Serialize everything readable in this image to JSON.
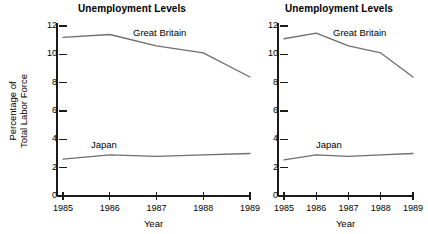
{
  "figure": {
    "background_color": "#ffffff",
    "line_color": "#6e6e6e",
    "axis_color": "#1a1a1a"
  },
  "charts": [
    {
      "id": "left",
      "title": "Unemployment Levels",
      "xlabel": "Year",
      "ylabel_line1": "Percentage of",
      "ylabel_line2": "Total Labor Force",
      "yticks": [
        "0",
        "2",
        "4",
        "6",
        "8",
        "10",
        "12"
      ],
      "xticks": [
        "1985",
        "1986",
        "1987",
        "1988",
        "1989"
      ],
      "series_labels": {
        "gb": "Great Britain",
        "japan": "Japan"
      }
    },
    {
      "id": "right",
      "title": "Unemployment Levels",
      "xlabel": "Year",
      "yticks": [
        "0",
        "2",
        "4",
        "6",
        "8",
        "10",
        "12"
      ],
      "xticks": [
        "1985",
        "1986",
        "1987",
        "1988",
        "1989"
      ],
      "series_labels": {
        "gb": "Great Britain",
        "japan": "Japan"
      }
    }
  ],
  "chart_data": [
    {
      "type": "line",
      "id": "left-chart",
      "title": "Unemployment Levels",
      "xlabel": "Year",
      "ylabel": "Percentage of Total Labor Force",
      "x": [
        1985,
        1986,
        1987,
        1988,
        1989
      ],
      "xtick_labels": [
        "1985",
        "1986",
        "1987",
        "1988",
        "1989"
      ],
      "ytick_labels": [
        "0",
        "2",
        "4",
        "6",
        "8",
        "10",
        "12"
      ],
      "xlim": [
        1985,
        1989
      ],
      "ylim": [
        0,
        12
      ],
      "grid": false,
      "legend": "inline-annotations",
      "series": [
        {
          "name": "Great Britain",
          "values": [
            11.2,
            11.4,
            10.6,
            10.1,
            8.4
          ]
        },
        {
          "name": "Japan",
          "values": [
            2.6,
            2.9,
            2.8,
            2.9,
            3.0
          ]
        }
      ]
    },
    {
      "type": "line",
      "id": "right-chart",
      "title": "Unemployment Levels",
      "xlabel": "Year",
      "ylabel": "",
      "x": [
        1985,
        1986,
        1987,
        1988,
        1989
      ],
      "xtick_labels": [
        "1985",
        "1986",
        "1987",
        "1988",
        "1989"
      ],
      "ytick_labels": [
        "0",
        "2",
        "4",
        "6",
        "8",
        "10",
        "12"
      ],
      "xlim": [
        1985,
        1989
      ],
      "ylim": [
        0,
        12
      ],
      "grid": false,
      "legend": "inline-annotations",
      "series": [
        {
          "name": "Great Britain",
          "values": [
            11.1,
            11.5,
            10.6,
            10.1,
            8.4
          ]
        },
        {
          "name": "Japan",
          "values": [
            2.55,
            2.9,
            2.8,
            2.9,
            3.0
          ]
        }
      ]
    }
  ]
}
